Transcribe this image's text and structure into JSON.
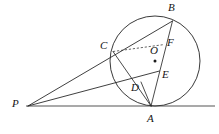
{
  "figure": {
    "kind": "circle-tangent-geometry-diagram",
    "background_color": "#ffffff",
    "ink_color": "#2a2a2a",
    "baseline_color": "#555555",
    "width": 219,
    "height": 134
  },
  "labels": {
    "P": "P",
    "A": "A",
    "B": "B",
    "C": "C",
    "D": "D",
    "E": "E",
    "F": "F",
    "O": "O"
  },
  "geometry": {
    "circle": {
      "cx": 155,
      "cy": 61,
      "r": 45
    },
    "center_dot": {
      "cx": 155,
      "cy": 61,
      "r": 1.5
    },
    "points": {
      "P": {
        "x": 28,
        "y": 106
      },
      "A": {
        "x": 151,
        "y": 106
      },
      "B": {
        "x": 172.5,
        "y": 21
      },
      "C": {
        "x": 113,
        "y": 51.5
      },
      "D": {
        "x": 141,
        "y": 82
      },
      "E": {
        "x": 159.5,
        "y": 71
      },
      "F": {
        "x": 164.5,
        "y": 44.5
      }
    },
    "baseline": {
      "x1": 26,
      "y1": 106,
      "x2": 215,
      "y2": 106
    },
    "segments": [
      {
        "name": "P-to-B-through-C",
        "from": "P",
        "to": "B"
      },
      {
        "name": "P-to-E",
        "from": "P",
        "to": "E"
      },
      {
        "name": "C-to-A",
        "from": "C",
        "to": "A"
      },
      {
        "name": "B-to-A",
        "from": "B",
        "to": "A"
      },
      {
        "name": "D-to-A",
        "from": "D",
        "to": "A"
      }
    ],
    "dashed_segments": [
      {
        "name": "C-to-F",
        "from": "C",
        "to": "F"
      }
    ]
  },
  "label_positions": {
    "P": {
      "x": 12,
      "y": 98
    },
    "A": {
      "x": 147,
      "y": 113
    },
    "B": {
      "x": 168,
      "y": 2
    },
    "C": {
      "x": 100,
      "y": 40
    },
    "D": {
      "x": 131,
      "y": 82
    },
    "E": {
      "x": 162,
      "y": 69
    },
    "F": {
      "x": 167,
      "y": 37
    },
    "O": {
      "x": 150,
      "y": 45
    }
  }
}
